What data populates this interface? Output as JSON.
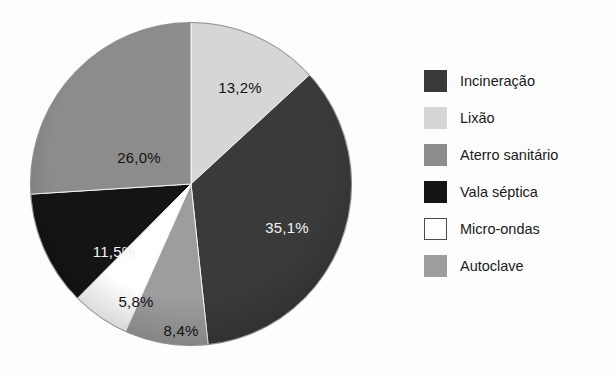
{
  "chart_data": {
    "type": "pie",
    "title": "",
    "xlabel": "",
    "ylabel": "",
    "legend_position": "right",
    "grid": false,
    "value_unit": "%",
    "decimal_separator": ",",
    "start_angle_deg": 0,
    "direction": "clockwise",
    "categories": [
      "Incineração",
      "Lixão",
      "Aterro sanitário",
      "Vala séptica",
      "Micro-ondas",
      "Autoclave"
    ],
    "values": [
      35.1,
      13.2,
      26.0,
      11.5,
      5.8,
      8.4
    ],
    "colors": [
      "#3a3a3a",
      "#d6d6d6",
      "#8c8c8c",
      "#141414",
      "#ffffff",
      "#9d9d9d"
    ],
    "slices": [
      {
        "name": "Lixão",
        "value": 13.2,
        "label": "13,2%",
        "color": "#d6d6d6",
        "label_color": "dark",
        "label_x": 212,
        "label_y": 67,
        "order": 1
      },
      {
        "name": "Incineração",
        "value": 35.1,
        "label": "35,1%",
        "color": "#3a3a3a",
        "label_color": "light",
        "label_x": 259,
        "label_y": 207,
        "order": 2
      },
      {
        "name": "Autoclave",
        "value": 8.4,
        "label": "8,4%",
        "color": "#9d9d9d",
        "label_color": "dark",
        "label_x": 153,
        "label_y": 310,
        "order": 3
      },
      {
        "name": "Micro-ondas",
        "value": 5.8,
        "label": "5,8%",
        "color": "#ffffff",
        "label_color": "dark",
        "label_x": 108,
        "label_y": 281,
        "order": 4
      },
      {
        "name": "Vala séptica",
        "value": 11.5,
        "label": "11,5%",
        "color": "#141414",
        "label_color": "light",
        "label_x": 86,
        "label_y": 231,
        "order": 5
      },
      {
        "name": "Aterro sanitário",
        "value": 26.0,
        "label": "26,0%",
        "color": "#8c8c8c",
        "label_color": "dark",
        "label_x": 111,
        "label_y": 137,
        "order": 6
      }
    ]
  },
  "legend": {
    "items": [
      {
        "label": "Incineração",
        "color": "#3a3a3a",
        "outlined": false
      },
      {
        "label": "Lixão",
        "color": "#d6d6d6",
        "outlined": false
      },
      {
        "label": "Aterro sanitário",
        "color": "#8c8c8c",
        "outlined": false
      },
      {
        "label": "Vala séptica",
        "color": "#141414",
        "outlined": false
      },
      {
        "label": "Micro-ondas",
        "color": "#ffffff",
        "outlined": true
      },
      {
        "label": "Autoclave",
        "color": "#9d9d9d",
        "outlined": false
      }
    ]
  }
}
